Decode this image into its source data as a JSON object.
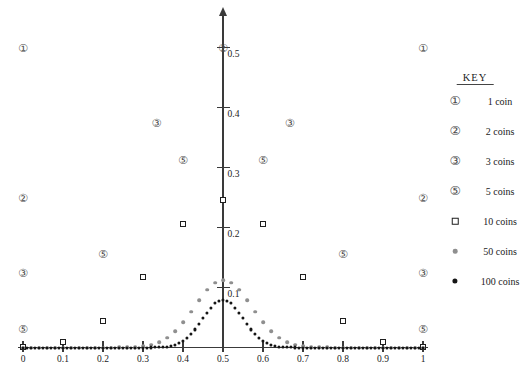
{
  "figure": {
    "background": "#ffffff",
    "axis_color": "#3a3a3a",
    "text_color": "#222222",
    "gray_dot_color": "#8f8f8f",
    "black_dot_color": "#151515"
  },
  "legend": {
    "title": "KEY",
    "items": [
      {
        "label": "1 coin",
        "marker": "circled-1",
        "glyph": "①"
      },
      {
        "label": "2 coins",
        "marker": "circled-2",
        "glyph": "②"
      },
      {
        "label": "3 coins",
        "marker": "circled-3",
        "glyph": "③"
      },
      {
        "label": "5 coins",
        "marker": "circled-5",
        "glyph": "⑤"
      },
      {
        "label": "10 coins",
        "marker": "open-square"
      },
      {
        "label": "50 coins",
        "marker": "gray-dot",
        "color": "#8f8f8f"
      },
      {
        "label": "100 coins",
        "marker": "black-dot",
        "color": "#151515"
      }
    ]
  },
  "chart_data": {
    "type": "scatter",
    "title": "",
    "xlabel": "",
    "ylabel": "",
    "xlim": [
      0,
      1
    ],
    "ylim": [
      0,
      0.55
    ],
    "grid": false,
    "legend_position": "right",
    "x_ticks": {
      "values": [
        0,
        0.1,
        0.2,
        0.3,
        0.4,
        0.5,
        0.6,
        0.7,
        0.8,
        0.9,
        1
      ],
      "labels": [
        "0",
        "0.1",
        "0.2",
        "0.3",
        "0.4",
        "0.5",
        "0.6",
        "0.7",
        "0.8",
        "0.9",
        "1"
      ]
    },
    "y_ticks": {
      "values": [
        0.1,
        0.2,
        0.3,
        0.4,
        0.5
      ],
      "labels": [
        "0.1",
        "0.2",
        "0.3",
        "0.4",
        "0.5"
      ]
    },
    "series": [
      {
        "name": "1 coin",
        "marker": "circled-1",
        "glyph": "①",
        "points": [
          [
            0,
            0.5
          ],
          [
            1,
            0.5
          ]
        ]
      },
      {
        "name": "2 coins",
        "marker": "circled-2",
        "glyph": "②",
        "points": [
          [
            0,
            0.25
          ],
          [
            0.5,
            0.5
          ],
          [
            1,
            0.25
          ]
        ]
      },
      {
        "name": "3 coins",
        "marker": "circled-3",
        "glyph": "③",
        "points": [
          [
            0,
            0.125
          ],
          [
            0.3333,
            0.375
          ],
          [
            0.6667,
            0.375
          ],
          [
            1,
            0.125
          ]
        ]
      },
      {
        "name": "5 coins",
        "marker": "circled-5",
        "glyph": "⑤",
        "points": [
          [
            0,
            0.0313
          ],
          [
            0.2,
            0.1563
          ],
          [
            0.4,
            0.3125
          ],
          [
            0.6,
            0.3125
          ],
          [
            0.8,
            0.1563
          ],
          [
            1,
            0.0313
          ]
        ]
      },
      {
        "name": "10 coins",
        "marker": "open-square",
        "points": [
          [
            0,
            0.001
          ],
          [
            0.1,
            0.0098
          ],
          [
            0.2,
            0.0439
          ],
          [
            0.3,
            0.1172
          ],
          [
            0.4,
            0.2051
          ],
          [
            0.5,
            0.2461
          ],
          [
            0.6,
            0.2051
          ],
          [
            0.7,
            0.1172
          ],
          [
            0.8,
            0.0439
          ],
          [
            0.9,
            0.0098
          ],
          [
            1,
            0.001
          ]
        ]
      },
      {
        "name": "50 coins",
        "marker": "gray-dot",
        "color": "#8f8f8f",
        "x_start": 0,
        "x_step": 0.02,
        "p_values": [
          0,
          0,
          0,
          0,
          0,
          0,
          0,
          0,
          0,
          0,
          0,
          0,
          0.0001,
          0.0003,
          0.0008,
          0.002,
          0.0044,
          0.0087,
          0.016,
          0.027,
          0.0419,
          0.0598,
          0.0788,
          0.096,
          0.108,
          0.1123,
          0.108,
          0.096,
          0.0788,
          0.0598,
          0.0419,
          0.027,
          0.016,
          0.0087,
          0.0044,
          0.002,
          0.0008,
          0.0003,
          0.0001,
          0,
          0,
          0,
          0,
          0,
          0,
          0,
          0,
          0,
          0,
          0,
          0
        ]
      },
      {
        "name": "100 coins",
        "marker": "black-dot",
        "color": "#151515",
        "x_start": 0,
        "x_step": 0.01,
        "p_values": [
          0,
          0,
          0,
          0,
          0,
          0,
          0,
          0,
          0,
          0,
          0,
          0,
          0,
          0,
          0,
          0,
          0,
          0,
          0,
          0,
          0,
          0,
          0,
          0,
          0,
          0,
          0,
          0,
          0,
          0,
          0,
          0,
          0.0001,
          0.0002,
          0.0005,
          0.0009,
          0.0016,
          0.0027,
          0.0045,
          0.0071,
          0.0108,
          0.0159,
          0.0223,
          0.0301,
          0.039,
          0.0485,
          0.058,
          0.0666,
          0.0735,
          0.078,
          0.0796,
          0.078,
          0.0735,
          0.0666,
          0.058,
          0.0485,
          0.039,
          0.0301,
          0.0223,
          0.0159,
          0.0108,
          0.0071,
          0.0045,
          0.0027,
          0.0016,
          0.0009,
          0.0005,
          0.0002,
          0.0001,
          0,
          0,
          0,
          0,
          0,
          0,
          0,
          0,
          0,
          0,
          0,
          0,
          0,
          0,
          0,
          0,
          0,
          0,
          0,
          0,
          0,
          0,
          0,
          0,
          0,
          0,
          0,
          0,
          0,
          0,
          0,
          0
        ]
      }
    ]
  }
}
